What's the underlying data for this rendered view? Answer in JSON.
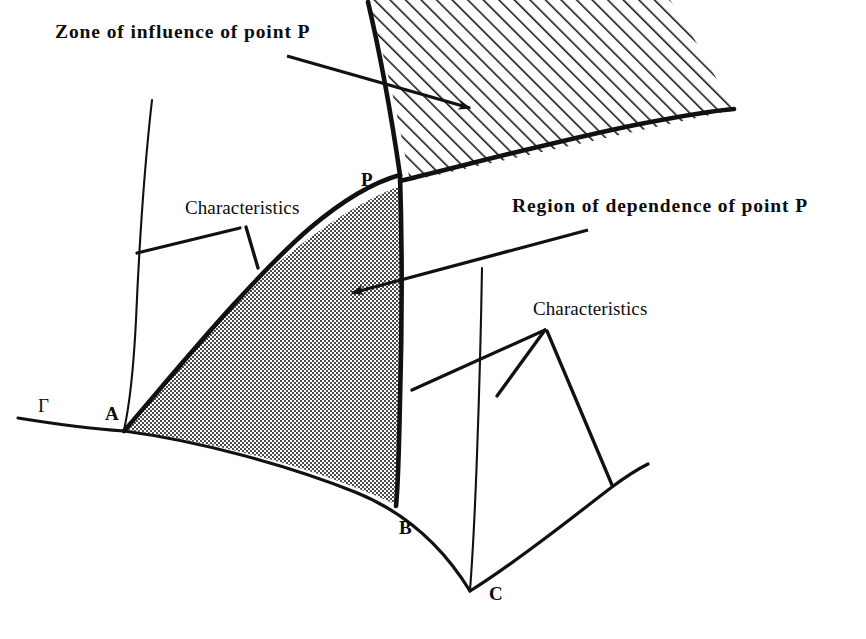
{
  "figure": {
    "background_color": "#ffffff",
    "ink_color": "#000000",
    "shaded_region_color": "#8a8a8a",
    "hatch_color": "#000000"
  },
  "captions": {
    "zone_of_influence": "Zone of influence of point P",
    "region_of_dependence": "Region of dependence of point P",
    "characteristics_left": "Characteristics",
    "characteristics_right": "Characteristics"
  },
  "point_labels": {
    "P": "P",
    "A": "A",
    "B": "B",
    "C": "C",
    "gamma": "Γ"
  },
  "regions": [
    {
      "name": "zone-of-influence",
      "fill": "diagonal-hatch",
      "label": "Zone of influence of point P",
      "position": "above point P, between the two characteristic curves emanating upward/right from P"
    },
    {
      "name": "region-of-dependence",
      "fill": "solid-gray",
      "label": "Region of dependence of point P",
      "position": "below point P, bounded by characteristics PA and PB and the boundary arc AB on Γ"
    }
  ],
  "curves": [
    {
      "name": "boundary-gamma",
      "style": "thin",
      "label": "Γ",
      "description": "initial data boundary curve running from lower left through A, under the shaded region, to B and down to the cusp at C then up to the right"
    },
    {
      "name": "characteristic-A-P",
      "style": "thick",
      "description": "characteristic from boundary point A rising to point P"
    },
    {
      "name": "characteristic-B-P-upper",
      "style": "thick",
      "description": "characteristic through B and P continuing up and left beyond P"
    },
    {
      "name": "characteristic-P-upper-right",
      "style": "thick",
      "description": "characteristic from P curving up and right forming lower edge of hatched zone"
    },
    {
      "name": "characteristic-thin-left",
      "style": "thin",
      "description": "thin characteristic curve left of the shaded region from near A to the top"
    },
    {
      "name": "characteristic-thin-right",
      "style": "thin",
      "description": "thin characteristic curve right of the shaded region descending to the cusp near C"
    }
  ],
  "leaders": [
    {
      "name": "leader-zone-of-influence",
      "from": "Zone of influence caption",
      "to": "hatched region",
      "arrowhead": true
    },
    {
      "name": "leader-region-of-dependence",
      "from": "Region of dependence caption",
      "to": "shaded region",
      "arrowhead": true
    },
    {
      "name": "leader-characteristics-left-1",
      "from": "Characteristics (left) caption",
      "to": "thin left characteristic curve",
      "arrowhead": false
    },
    {
      "name": "leader-characteristics-left-2",
      "from": "Characteristics (left) caption",
      "to": "thick characteristic A-P",
      "arrowhead": false
    },
    {
      "name": "leader-characteristics-right-1",
      "from": "Characteristics (right) caption",
      "to": "thick characteristic near B",
      "arrowhead": false
    },
    {
      "name": "leader-characteristics-right-2",
      "from": "Characteristics (right) caption",
      "to": "thin right characteristic curve",
      "arrowhead": false
    },
    {
      "name": "leader-characteristics-right-3",
      "from": "Characteristics (right) caption",
      "to": "boundary Γ right of C",
      "arrowhead": false
    }
  ]
}
